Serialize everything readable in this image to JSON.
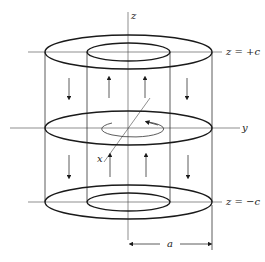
{
  "diagram": {
    "type": "hollow-cylinder-magnetization",
    "labels": {
      "z_axis": "z",
      "y_axis": "y",
      "x_axis": "x",
      "top_plane": "z = +c",
      "bottom_plane": "z = −c",
      "radius": "a"
    },
    "arrows": {
      "outer_wall_direction": "down",
      "inner_wall_direction": "up",
      "midplane_rotation": "counterclockwise"
    }
  }
}
